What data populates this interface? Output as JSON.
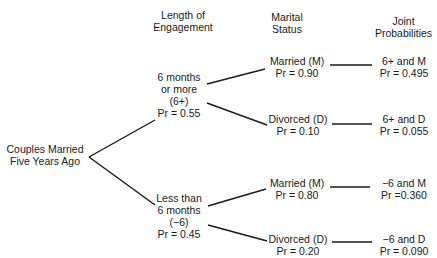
{
  "headers": {
    "engagement": [
      "Length of",
      "Engagement"
    ],
    "marital": [
      "Marital",
      "Status"
    ],
    "joint": [
      "Joint",
      "Probabilities"
    ]
  },
  "root": [
    "Couples Married",
    "Five Years Ago"
  ],
  "engagement_nodes": [
    {
      "lines": [
        "6 months",
        "or more",
        "(6+)",
        "Pr = 0.55"
      ]
    },
    {
      "lines": [
        "Less than",
        "6 months",
        "(−6)",
        "Pr = 0.45"
      ]
    }
  ],
  "status_nodes": [
    {
      "lines": [
        "Married (M)",
        "Pr = 0.90"
      ]
    },
    {
      "lines": [
        "Divorced (D)",
        "Pr = 0.10"
      ]
    },
    {
      "lines": [
        "Married (M)",
        "Pr = 0.80"
      ]
    },
    {
      "lines": [
        "Divorced (D)",
        "Pr = 0.20"
      ]
    }
  ],
  "joint_nodes": [
    {
      "lines": [
        "6+ and M",
        "Pr = 0.495"
      ]
    },
    {
      "lines": [
        "6+ and D",
        "Pr = 0.055"
      ]
    },
    {
      "lines": [
        "−6 and M",
        "Pr =0.360"
      ]
    },
    {
      "lines": [
        "−6 and D",
        "Pr = 0.090"
      ]
    }
  ]
}
